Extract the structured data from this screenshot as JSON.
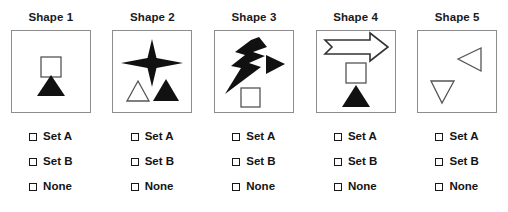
{
  "page": {
    "background_color": "#ffffff",
    "panel_border_color": "#8d8d8d",
    "fill_color": "#111111",
    "outline_color": "#555555"
  },
  "columns": [
    {
      "title": "Shape 1",
      "panel_name": "shape-panel-1",
      "figures": [
        {
          "name": "square-outline",
          "style": "outline"
        },
        {
          "name": "triangle-up-filled",
          "style": "filled"
        }
      ],
      "options": [
        {
          "label": "Set A",
          "checked": false
        },
        {
          "label": "Set B",
          "checked": false
        },
        {
          "label": "None",
          "checked": false
        }
      ]
    },
    {
      "title": "Shape 2",
      "panel_name": "shape-panel-2",
      "figures": [
        {
          "name": "four-pointed-star-filled",
          "style": "filled"
        },
        {
          "name": "triangle-up-outline",
          "style": "outline"
        },
        {
          "name": "triangle-up-filled",
          "style": "filled"
        }
      ],
      "options": [
        {
          "label": "Set A",
          "checked": false
        },
        {
          "label": "Set B",
          "checked": false
        },
        {
          "label": "None",
          "checked": false
        }
      ]
    },
    {
      "title": "Shape 3",
      "panel_name": "shape-panel-3",
      "figures": [
        {
          "name": "lightning-bolt-filled",
          "style": "filled"
        },
        {
          "name": "triangle-right-filled",
          "style": "filled"
        },
        {
          "name": "square-outline",
          "style": "outline"
        }
      ],
      "options": [
        {
          "label": "Set A",
          "checked": false
        },
        {
          "label": "Set B",
          "checked": false
        },
        {
          "label": "None",
          "checked": false
        }
      ]
    },
    {
      "title": "Shape 4",
      "panel_name": "shape-panel-4",
      "figures": [
        {
          "name": "arrow-right-outline",
          "style": "outline"
        },
        {
          "name": "square-outline",
          "style": "outline"
        },
        {
          "name": "triangle-up-filled",
          "style": "filled"
        }
      ],
      "options": [
        {
          "label": "Set A",
          "checked": false
        },
        {
          "label": "Set B",
          "checked": false
        },
        {
          "label": "None",
          "checked": false
        }
      ]
    },
    {
      "title": "Shape 5",
      "panel_name": "shape-panel-5",
      "figures": [
        {
          "name": "triangle-left-outline",
          "style": "outline"
        },
        {
          "name": "triangle-down-outline",
          "style": "outline"
        }
      ],
      "options": [
        {
          "label": "Set A",
          "checked": false
        },
        {
          "label": "Set B",
          "checked": false
        },
        {
          "label": "None",
          "checked": false
        }
      ]
    }
  ]
}
